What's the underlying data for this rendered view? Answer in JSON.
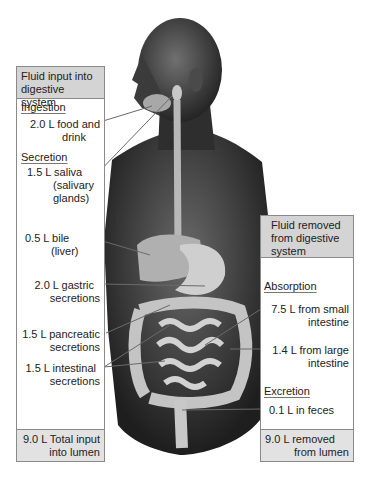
{
  "left_box": {
    "header": [
      "Fluid input into",
      "digestive system"
    ],
    "sections": [
      {
        "title": "Ingestion"
      },
      {
        "title": "Secretion"
      }
    ],
    "items": [
      {
        "lines": [
          "2.0 L food and",
          "drink"
        ]
      },
      {
        "lines": [
          "1.5 L saliva",
          "(salivary",
          "glands)"
        ]
      },
      {
        "lines": [
          "0.5 L bile",
          "(liver)"
        ]
      },
      {
        "lines": [
          "2.0 L gastric",
          "secretions"
        ]
      },
      {
        "lines": [
          "1.5 L pancreatic",
          "secretions"
        ]
      },
      {
        "lines": [
          "1.5 L intestinal",
          "secretions"
        ]
      }
    ],
    "footer": [
      "9.0 L Total input",
      "into lumen"
    ]
  },
  "right_box": {
    "header": [
      "Fluid removed",
      "from digestive",
      "system"
    ],
    "sections": [
      {
        "title": "Absorption"
      },
      {
        "title": "Excretion"
      }
    ],
    "items": [
      {
        "lines": [
          "7.5 L from small",
          "intestine"
        ]
      },
      {
        "lines": [
          "1.4 L from large",
          "intestine"
        ]
      },
      {
        "lines": [
          "0.1 L in feces"
        ]
      }
    ],
    "footer": [
      "9.0 L removed",
      "from lumen"
    ]
  },
  "colors": {
    "box_border": "#8a8a8a",
    "header_fill": "#d4d4d4",
    "footer_fill": "#e2e2e2",
    "leader_line": "#6a6a6a",
    "skin": "#3a3a3a",
    "organ": "#bdbdbd"
  }
}
